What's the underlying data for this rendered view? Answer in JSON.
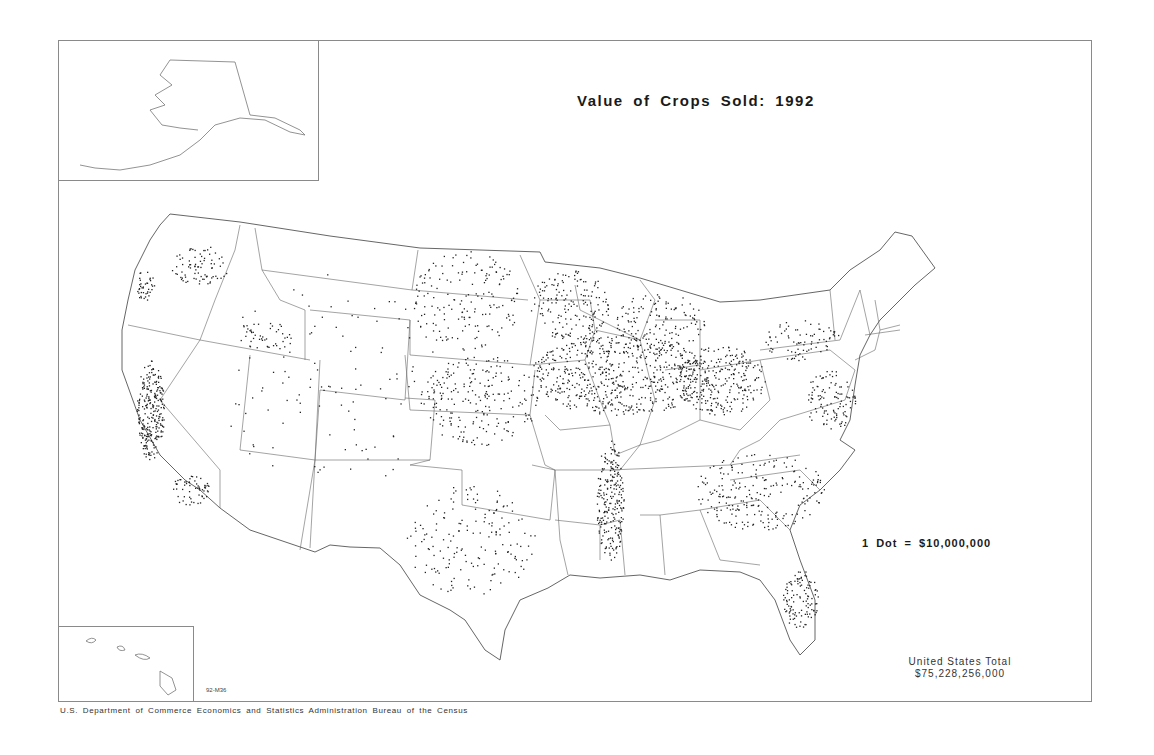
{
  "map": {
    "title": "Value of Crops Sold: 1992",
    "legend": "1 Dot = $10,000,000",
    "total_label": "United States Total",
    "total_value": "$75,228,256,000",
    "map_code": "92-M36",
    "footer": "U.S. Department of Commerce   Economics and Statistics Administration   Bureau of the Census",
    "insets": [
      "Alaska",
      "Hawaii"
    ],
    "colors": {
      "frame": "#8a8a8a",
      "boundary": "#555555",
      "dot": "#222222",
      "background": "#ffffff"
    },
    "dot_clusters": [
      {
        "region": "Central Valley CA",
        "cx": 150,
        "cy": 410,
        "rx": 14,
        "ry": 50,
        "n": 260
      },
      {
        "region": "Southern CA",
        "cx": 190,
        "cy": 490,
        "rx": 20,
        "ry": 15,
        "n": 60
      },
      {
        "region": "Eastern WA",
        "cx": 200,
        "cy": 265,
        "rx": 30,
        "ry": 20,
        "n": 80
      },
      {
        "region": "Willamette OR",
        "cx": 145,
        "cy": 285,
        "rx": 10,
        "ry": 15,
        "n": 40
      },
      {
        "region": "Snake River ID",
        "cx": 265,
        "cy": 335,
        "rx": 30,
        "ry": 15,
        "n": 45
      },
      {
        "region": "Iowa/Illinois Corn Belt",
        "cx": 620,
        "cy": 375,
        "rx": 90,
        "ry": 40,
        "n": 620
      },
      {
        "region": "Indiana/Ohio",
        "cx": 720,
        "cy": 380,
        "rx": 45,
        "ry": 35,
        "n": 260
      },
      {
        "region": "Minnesota",
        "cx": 570,
        "cy": 305,
        "rx": 40,
        "ry": 35,
        "n": 170
      },
      {
        "region": "Dakotas",
        "cx": 465,
        "cy": 300,
        "rx": 55,
        "ry": 50,
        "n": 170
      },
      {
        "region": "Kansas/Nebraska",
        "cx": 480,
        "cy": 400,
        "rx": 60,
        "ry": 45,
        "n": 220
      },
      {
        "region": "Mississippi Delta",
        "cx": 610,
        "cy": 500,
        "rx": 14,
        "ry": 60,
        "n": 230
      },
      {
        "region": "Texas",
        "cx": 470,
        "cy": 540,
        "rx": 65,
        "ry": 55,
        "n": 170
      },
      {
        "region": "Southeast",
        "cx": 760,
        "cy": 490,
        "rx": 65,
        "ry": 40,
        "n": 230
      },
      {
        "region": "Florida",
        "cx": 800,
        "cy": 600,
        "rx": 18,
        "ry": 30,
        "n": 110
      },
      {
        "region": "Mid-Atlantic",
        "cx": 830,
        "cy": 400,
        "rx": 25,
        "ry": 30,
        "n": 110
      },
      {
        "region": "New York/Pennsylvania",
        "cx": 800,
        "cy": 340,
        "rx": 40,
        "ry": 20,
        "n": 80
      },
      {
        "region": "Michigan/Wisconsin",
        "cx": 660,
        "cy": 320,
        "rx": 45,
        "ry": 30,
        "n": 130
      },
      {
        "region": "Mountain West sparse",
        "cx": 330,
        "cy": 380,
        "rx": 110,
        "ry": 110,
        "n": 110
      }
    ]
  }
}
